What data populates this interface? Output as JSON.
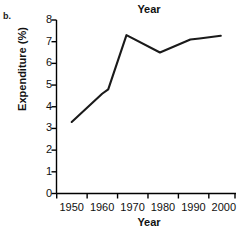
{
  "figure": {
    "panel_label": "b.",
    "title": "Year",
    "background": "#ffffff",
    "line_color": "#1a1a1a",
    "axis_color": "#000000"
  },
  "chart_data": {
    "type": "line",
    "title": "Year",
    "xlabel": "Year",
    "ylabel": "Expenditure (%)",
    "xlim": [
      1945,
      2004
    ],
    "ylim": [
      0,
      8
    ],
    "grid": false,
    "legend": "none",
    "xticks": [
      1950,
      1960,
      1970,
      1980,
      1990,
      2000
    ],
    "xticklabels": [
      "1950",
      "1960",
      "1970",
      "1980",
      "1990",
      "2000"
    ],
    "yticks": [
      0,
      1,
      2,
      3,
      4,
      5,
      6,
      7,
      8
    ],
    "yticklabels": [
      "0",
      "1",
      "2",
      "3",
      "4",
      "5",
      "6",
      "7",
      "8"
    ],
    "series": [
      {
        "name": "Expenditure",
        "x": [
          1950,
          1960,
          1962,
          1968,
          1979,
          1989,
          1992,
          1999
        ],
        "values": [
          3.3,
          4.6,
          4.8,
          7.3,
          6.5,
          7.1,
          7.15,
          7.27
        ]
      }
    ]
  }
}
